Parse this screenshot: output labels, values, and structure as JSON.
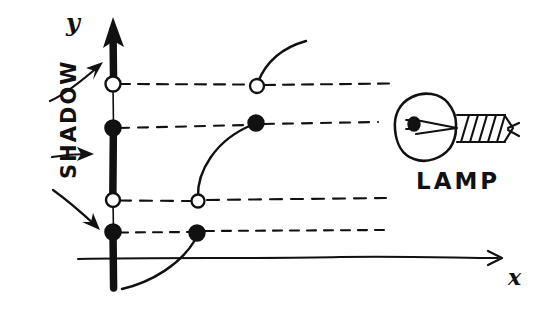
{
  "figure": {
    "kind": "hand-drawn-sketch",
    "width": 548,
    "height": 312,
    "background_color": "#ffffff",
    "ink_color": "#111111"
  },
  "axes": {
    "y_axis": {
      "label": "y",
      "label_x": 66,
      "label_y": 8,
      "x": 113,
      "top_y": 18,
      "bottom_y": 288,
      "arrow": "up"
    },
    "x_axis": {
      "label": "x",
      "label_x": 508,
      "label_y": 264,
      "y": 258,
      "left_x": 78,
      "right_x": 502,
      "arrow": "right"
    }
  },
  "shadow": {
    "label": "SHADOW",
    "description": "thick dark segments of the y-axis that receive no light",
    "segments": [
      {
        "name": "shadow-segment-top",
        "y_start": 18,
        "y_end": 84
      },
      {
        "name": "shadow-segment-middle",
        "y_start": 128,
        "y_end": 200
      },
      {
        "name": "shadow-segment-bottom",
        "y_start": 232,
        "y_end": 288
      }
    ],
    "lit_segments": [
      {
        "name": "lit-segment-upper",
        "y_start": 84,
        "y_end": 128
      },
      {
        "name": "lit-segment-lower",
        "y_start": 200,
        "y_end": 232
      }
    ],
    "arrows": [
      {
        "name": "shadow-arrow-upper",
        "x1": 50,
        "y1": 101,
        "x2": 101,
        "y2": 64
      },
      {
        "name": "shadow-arrow-middle",
        "x1": 52,
        "y1": 157,
        "x2": 93,
        "y2": 154
      },
      {
        "name": "shadow-arrow-lower",
        "x1": 53,
        "y1": 190,
        "x2": 99,
        "y2": 229
      }
    ]
  },
  "axis_points": [
    {
      "name": "axis-point-1",
      "style": "open",
      "x": 113,
      "y": 84
    },
    {
      "name": "axis-point-2",
      "style": "filled",
      "x": 113,
      "y": 128
    },
    {
      "name": "axis-point-3",
      "style": "open",
      "x": 113,
      "y": 200
    },
    {
      "name": "axis-point-4",
      "style": "filled",
      "x": 113,
      "y": 232
    }
  ],
  "light_rays": [
    {
      "name": "light-ray-1",
      "y": 84,
      "x_start": 118,
      "x_end": 390,
      "style": "dashed"
    },
    {
      "name": "light-ray-2",
      "y": 124,
      "x_start": 118,
      "x_end": 378,
      "style": "dashed"
    },
    {
      "name": "light-ray-3",
      "y": 200,
      "x_start": 118,
      "x_end": 386,
      "style": "dashed"
    },
    {
      "name": "light-ray-4",
      "y": 232,
      "x_start": 118,
      "x_end": 386,
      "style": "dashed"
    }
  ],
  "curves": [
    {
      "name": "curve-upper",
      "description": "upper arc rising to the right from an open endpoint",
      "path": "M 257 85 C 268 62 282 48 305 42",
      "endpoints": [
        {
          "name": "curve-upper-endpoint-open",
          "style": "open",
          "x": 257,
          "y": 85
        },
        {
          "name": "curve-upper-endpoint-free",
          "style": "none",
          "x": 305,
          "y": 42
        }
      ]
    },
    {
      "name": "curve-middle",
      "description": "arc from an open point on ray 3 up to a filled point on ray 2",
      "path": "M 199 201 C 199 178 214 141 254 124",
      "endpoints": [
        {
          "name": "curve-middle-endpoint-open",
          "style": "open",
          "x": 199,
          "y": 201
        },
        {
          "name": "curve-middle-endpoint-filled",
          "style": "filled",
          "x": 255,
          "y": 124
        }
      ]
    },
    {
      "name": "curve-lower",
      "description": "arc rising from below the x-axis to a filled point on ray 4",
      "path": "M 122 288 C 150 281 183 262 197 234",
      "endpoints": [
        {
          "name": "curve-lower-endpoint-filled",
          "style": "filled",
          "x": 197,
          "y": 233
        },
        {
          "name": "curve-lower-endpoint-free",
          "style": "none",
          "x": 122,
          "y": 288
        }
      ]
    }
  ],
  "lamp": {
    "label": "LAMP",
    "label_x": 416,
    "label_y": 168,
    "bulb": {
      "name": "lamp-bulb",
      "cx": 427,
      "cy": 125,
      "rx": 30,
      "ry": 33
    },
    "filament": {
      "name": "lamp-filament",
      "cx": 414,
      "cy": 124
    },
    "screw_base": {
      "name": "lamp-screw-base",
      "x_start": 456,
      "x_end": 513,
      "cy": 128,
      "turns": 6
    }
  }
}
